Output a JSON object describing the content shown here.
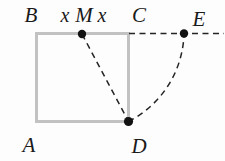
{
  "diagram": {
    "point_labels": {
      "A": "A",
      "B": "B",
      "C": "C",
      "D": "D",
      "E": "E",
      "M": "M"
    },
    "tick_labels": {
      "left": "x",
      "right": "x"
    },
    "colors": {
      "background": "#fdfdfd",
      "square_stroke": "#c2c2c2",
      "dashed_line": "#242424",
      "point_dot": "#121212",
      "label_text": "#1a1a1a"
    }
  }
}
